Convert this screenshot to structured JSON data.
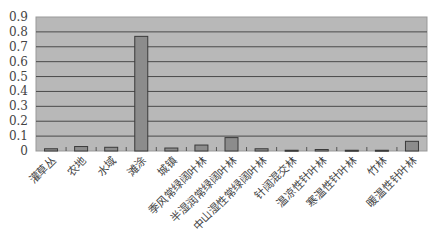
{
  "chart_data": {
    "type": "bar",
    "title": "",
    "xlabel": "",
    "ylabel": "",
    "ylim": [
      0,
      0.9
    ],
    "yticks": [
      "0",
      "0.1",
      "0.2",
      "0.3",
      "0.4",
      "0.5",
      "0.6",
      "0.7",
      "0.8",
      "0.9"
    ],
    "grid": true,
    "legend": null,
    "categories": [
      "灌草丛",
      "农地",
      "水域",
      "滩涂",
      "城镇",
      "季风常绿阔叶林",
      "半湿润常绿阔叶林",
      "中山湿性常绿阔叶林",
      "针阔混交林",
      "温凉性针叶林",
      "寒温性针叶林",
      "竹林",
      "暖温性针叶林"
    ],
    "values": [
      0.015,
      0.03,
      0.025,
      0.77,
      0.02,
      0.04,
      0.09,
      0.015,
      0.005,
      0.01,
      0.005,
      0.005,
      0.065
    ]
  },
  "colors": {
    "plot_background": "#b8b8b8",
    "bar_fill": "#8c8c8c",
    "bar_stroke": "#3a3a3a",
    "gridline": "#4a4a4a"
  }
}
